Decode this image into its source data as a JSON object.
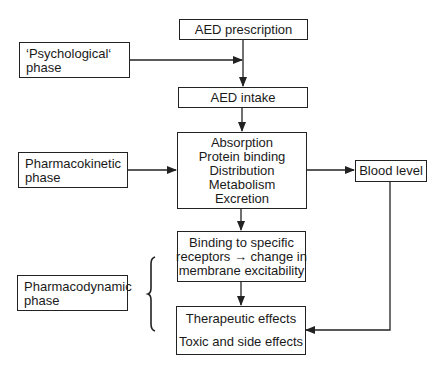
{
  "diagram": {
    "nodes": {
      "prescription": {
        "label": "AED prescription"
      },
      "psychological": {
        "lines": [
          "‘Psychological‘",
          "phase"
        ]
      },
      "intake": {
        "label": "AED intake"
      },
      "pharmacokinetics": {
        "lines": [
          "Absorption",
          "Protein binding",
          "Distribution",
          "Metabolism",
          "Excretion"
        ]
      },
      "pharmacokinetic_phase": {
        "lines": [
          "Pharmacokinetic",
          "phase"
        ]
      },
      "blood_level": {
        "label": "Blood level"
      },
      "binding": {
        "lines": [
          "Binding to specific",
          "receptors → change in",
          "membrane excitability"
        ]
      },
      "pharmacodynamic_phase": {
        "lines": [
          "Pharmacodynamic",
          "phase"
        ]
      },
      "effects": {
        "lines": [
          "Therapeutic effects",
          "Toxic and side effects"
        ]
      }
    },
    "edges": [
      {
        "from": "prescription",
        "to": "intake"
      },
      {
        "from": "psychological",
        "to": "prescription-intake-line"
      },
      {
        "from": "intake",
        "to": "pharmacokinetics"
      },
      {
        "from": "pharmacokinetic_phase",
        "to": "pharmacokinetics"
      },
      {
        "from": "pharmacokinetics",
        "to": "blood_level"
      },
      {
        "from": "pharmacokinetics",
        "to": "binding"
      },
      {
        "from": "binding",
        "to": "effects"
      },
      {
        "from": "blood_level",
        "to": "effects"
      }
    ],
    "colors": {
      "stroke": "#222222",
      "background": "#ffffff"
    }
  }
}
